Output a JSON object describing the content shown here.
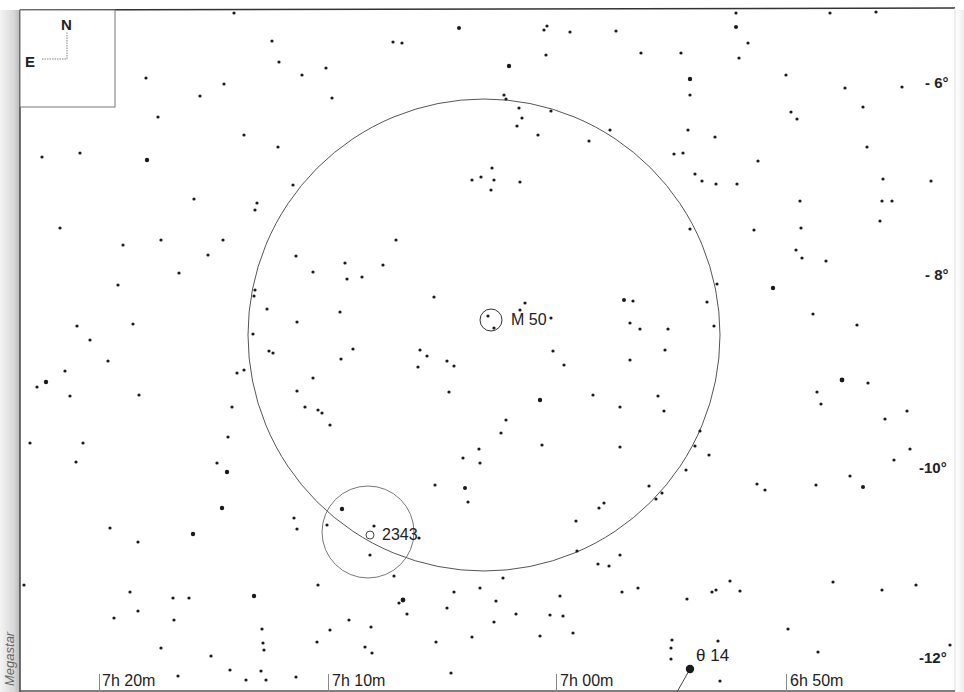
{
  "chart": {
    "title": "",
    "watermark": "Megastar",
    "compass": {
      "north": "N",
      "east": "E"
    },
    "dec_labels": [
      {
        "text": "- 6°",
        "x": 925,
        "y": 74
      },
      {
        "text": "- 8°",
        "x": 925,
        "y": 266
      },
      {
        "text": "-10°",
        "x": 920,
        "y": 460
      },
      {
        "text": "-12°",
        "x": 920,
        "y": 650
      }
    ],
    "ra_labels": [
      {
        "text": "7h 20m",
        "x": 102,
        "tick_x": 99
      },
      {
        "text": "7h 10m",
        "x": 332,
        "tick_x": 328
      },
      {
        "text": "7h 00m",
        "x": 560,
        "tick_x": 556
      },
      {
        "text": "6h 50m",
        "x": 790,
        "tick_x": 786
      }
    ],
    "objects": [
      {
        "name": "M 50",
        "label_x": 511,
        "label_y": 312,
        "marker": {
          "cx": 491,
          "cy": 320,
          "r": 11
        }
      },
      {
        "name": "2343",
        "label_x": 382,
        "label_y": 527,
        "marker": {
          "cx": 370,
          "cy": 535,
          "r": 4
        }
      },
      {
        "name": "θ 14",
        "label_x": 696,
        "label_y": 647
      }
    ],
    "fields_of_view": [
      {
        "name": "large-fov-circle",
        "cx": 484,
        "cy": 335,
        "r": 236
      },
      {
        "name": "small-fov-circle",
        "cx": 368,
        "cy": 532,
        "r": 46
      }
    ],
    "colors": {
      "background": "#ffffff",
      "star": "#1a1a1a",
      "line": "#555555",
      "text": "#222222"
    }
  },
  "chart_data": {
    "type": "scatter",
    "xlabel": "Right Ascension",
    "ylabel": "Declination",
    "x_ticks": [
      "7h 20m",
      "7h 10m",
      "7h 00m",
      "6h 50m"
    ],
    "y_ticks": [
      "-6°",
      "-8°",
      "-10°",
      "-12°"
    ],
    "annotations": [
      "M 50",
      "2343",
      "θ 14",
      "N",
      "E"
    ],
    "grid": false,
    "stars": [
      [
        234,
        13,
        1.6
      ],
      [
        272,
        41,
        1.6
      ],
      [
        279,
        62,
        1.6
      ],
      [
        302,
        75,
        1.6
      ],
      [
        326,
        68,
        1.6
      ],
      [
        332,
        98,
        1.6
      ],
      [
        393,
        42,
        1.6
      ],
      [
        402,
        43,
        1.6
      ],
      [
        459,
        28,
        2
      ],
      [
        146,
        78,
        1.6
      ],
      [
        200,
        96,
        1.6
      ],
      [
        224,
        84,
        1.6
      ],
      [
        158,
        117,
        1.6
      ],
      [
        244,
        135,
        1.6
      ],
      [
        278,
        147,
        1.6
      ],
      [
        42,
        157,
        1.6
      ],
      [
        80,
        153,
        1.6
      ],
      [
        147,
        160,
        2.2
      ],
      [
        194,
        199,
        1.6
      ],
      [
        257,
        203,
        1.6
      ],
      [
        60,
        228,
        1.6
      ],
      [
        123,
        245,
        1.6
      ],
      [
        161,
        240,
        1.6
      ],
      [
        179,
        273,
        1.6
      ],
      [
        223,
        240,
        1.6
      ],
      [
        208,
        255,
        1.6
      ],
      [
        118,
        285,
        1.6
      ],
      [
        133,
        324,
        1.6
      ],
      [
        77,
        326,
        1.6
      ],
      [
        90,
        340,
        1.6
      ],
      [
        108,
        361,
        1.6
      ],
      [
        46,
        382,
        2.2
      ],
      [
        65,
        371,
        1.6
      ],
      [
        37,
        387,
        1.6
      ],
      [
        70,
        396,
        1.6
      ],
      [
        139,
        395,
        1.6
      ],
      [
        83,
        443,
        1.6
      ],
      [
        76,
        462,
        1.6
      ],
      [
        30,
        443,
        1.6
      ],
      [
        237,
        373,
        1.6
      ],
      [
        244,
        370,
        1.6
      ],
      [
        232,
        407,
        1.6
      ],
      [
        228,
        437,
        1.6
      ],
      [
        217,
        463,
        1.6
      ],
      [
        227,
        472,
        2.2
      ],
      [
        222,
        508,
        2.2
      ],
      [
        193,
        534,
        2.2
      ],
      [
        110,
        528,
        1.6
      ],
      [
        138,
        542,
        1.6
      ],
      [
        24,
        585,
        1.6
      ],
      [
        130,
        592,
        1.6
      ],
      [
        138,
        611,
        1.6
      ],
      [
        173,
        598,
        1.6
      ],
      [
        189,
        598,
        1.6
      ],
      [
        254,
        596,
        2.2
      ],
      [
        114,
        618,
        1.6
      ],
      [
        174,
        620,
        1.6
      ],
      [
        211,
        656,
        1.6
      ],
      [
        161,
        648,
        1.6
      ],
      [
        262,
        629,
        1.6
      ],
      [
        263,
        643,
        1.6
      ],
      [
        293,
        185,
        1.6
      ],
      [
        255,
        290,
        1.6
      ],
      [
        255,
        210,
        1.6
      ],
      [
        296,
        256,
        1.6
      ],
      [
        313,
        272,
        1.6
      ],
      [
        345,
        263,
        1.6
      ],
      [
        347,
        279,
        1.6
      ],
      [
        362,
        277,
        1.6
      ],
      [
        383,
        265,
        1.6
      ],
      [
        396,
        240,
        1.6
      ],
      [
        254,
        296,
        1.6
      ],
      [
        267,
        309,
        1.6
      ],
      [
        269,
        351,
        1.6
      ],
      [
        253,
        334,
        1.6
      ],
      [
        273,
        353,
        1.6
      ],
      [
        297,
        322,
        1.6
      ],
      [
        353,
        349,
        1.6
      ],
      [
        340,
        312,
        1.6
      ],
      [
        341,
        359,
        1.6
      ],
      [
        313,
        378,
        1.6
      ],
      [
        305,
        407,
        1.6
      ],
      [
        322,
        413,
        1.6
      ],
      [
        318,
        410,
        1.6
      ],
      [
        297,
        391,
        1.6
      ],
      [
        330,
        425,
        1.6
      ],
      [
        434,
        297,
        1.6
      ],
      [
        420,
        350,
        1.6
      ],
      [
        427,
        356,
        1.6
      ],
      [
        418,
        367,
        1.6
      ],
      [
        447,
        361,
        1.6
      ],
      [
        449,
        392,
        1.6
      ],
      [
        454,
        366,
        1.6
      ],
      [
        488,
        316,
        1.6
      ],
      [
        494,
        328,
        1.6
      ],
      [
        525,
        303,
        1.6
      ],
      [
        520,
        310,
        1.6
      ],
      [
        551,
        318,
        1.6
      ],
      [
        553,
        351,
        1.6
      ],
      [
        564,
        365,
        1.6
      ],
      [
        624,
        300,
        2
      ],
      [
        633,
        301,
        1.6
      ],
      [
        630,
        323,
        1.6
      ],
      [
        630,
        360,
        1.6
      ],
      [
        640,
        329,
        1.6
      ],
      [
        668,
        329,
        1.6
      ],
      [
        665,
        350,
        1.6
      ],
      [
        658,
        396,
        1.6
      ],
      [
        664,
        411,
        1.6
      ],
      [
        540,
        400,
        2.2
      ],
      [
        506,
        420,
        1.6
      ],
      [
        542,
        445,
        1.6
      ],
      [
        501,
        433,
        1.6
      ],
      [
        479,
        449,
        1.6
      ],
      [
        463,
        458,
        1.6
      ],
      [
        480,
        463,
        1.6
      ],
      [
        593,
        395,
        1.6
      ],
      [
        620,
        407,
        1.6
      ],
      [
        620,
        447,
        1.6
      ],
      [
        472,
        180,
        1.6
      ],
      [
        481,
        177,
        1.6
      ],
      [
        492,
        168,
        1.6
      ],
      [
        494,
        180,
        1.6
      ],
      [
        491,
        190,
        1.6
      ],
      [
        520,
        182,
        1.6
      ],
      [
        519,
        108,
        1.6
      ],
      [
        522,
        118,
        1.6
      ],
      [
        517,
        126,
        1.6
      ],
      [
        538,
        135,
        1.6
      ],
      [
        551,
        111,
        1.6
      ],
      [
        589,
        141,
        1.6
      ],
      [
        610,
        130,
        1.6
      ],
      [
        506,
        99,
        1.6
      ],
      [
        504,
        95,
        1.6
      ],
      [
        509,
        66,
        2.2
      ],
      [
        546,
        55,
        1.6
      ],
      [
        547,
        26,
        1.6
      ],
      [
        544,
        30,
        1.6
      ],
      [
        570,
        32,
        1.6
      ],
      [
        616,
        31,
        1.6
      ],
      [
        641,
        53,
        1.6
      ],
      [
        681,
        53,
        1.6
      ],
      [
        690,
        79,
        2.2
      ],
      [
        690,
        95,
        1.6
      ],
      [
        688,
        130,
        1.6
      ],
      [
        674,
        154,
        1.6
      ],
      [
        683,
        153,
        1.6
      ],
      [
        715,
        137,
        1.6
      ],
      [
        695,
        174,
        1.6
      ],
      [
        702,
        181,
        1.6
      ],
      [
        716,
        184,
        1.6
      ],
      [
        736,
        13,
        1.6
      ],
      [
        736,
        27,
        2
      ],
      [
        748,
        43,
        1.6
      ],
      [
        739,
        58,
        1.6
      ],
      [
        786,
        75,
        1.6
      ],
      [
        791,
        112,
        1.6
      ],
      [
        797,
        119,
        1.6
      ],
      [
        830,
        13,
        1.6
      ],
      [
        876,
        12,
        1.6
      ],
      [
        845,
        88,
        1.6
      ],
      [
        902,
        87,
        1.6
      ],
      [
        863,
        107,
        1.6
      ],
      [
        867,
        147,
        1.6
      ],
      [
        883,
        179,
        1.6
      ],
      [
        931,
        181,
        1.6
      ],
      [
        882,
        201,
        1.6
      ],
      [
        892,
        201,
        1.6
      ],
      [
        880,
        221,
        1.6
      ],
      [
        800,
        201,
        1.6
      ],
      [
        801,
        228,
        1.6
      ],
      [
        758,
        161,
        1.6
      ],
      [
        737,
        184,
        1.6
      ],
      [
        754,
        230,
        1.6
      ],
      [
        796,
        250,
        1.6
      ],
      [
        802,
        258,
        1.6
      ],
      [
        826,
        261,
        1.6
      ],
      [
        773,
        288,
        2.2
      ],
      [
        813,
        314,
        1.6
      ],
      [
        857,
        325,
        1.6
      ],
      [
        842,
        380,
        2.4
      ],
      [
        868,
        383,
        1.6
      ],
      [
        817,
        392,
        1.6
      ],
      [
        885,
        419,
        1.6
      ],
      [
        907,
        411,
        1.6
      ],
      [
        910,
        449,
        1.6
      ],
      [
        863,
        487,
        2
      ],
      [
        816,
        485,
        1.6
      ],
      [
        821,
        404,
        1.6
      ],
      [
        850,
        476,
        1.6
      ],
      [
        894,
        460,
        1.6
      ],
      [
        690,
        229,
        1.6
      ],
      [
        717,
        284,
        1.6
      ],
      [
        707,
        302,
        1.6
      ],
      [
        714,
        326,
        1.6
      ],
      [
        695,
        446,
        1.6
      ],
      [
        700,
        431,
        1.6
      ],
      [
        709,
        455,
        1.6
      ],
      [
        686,
        470,
        1.6
      ],
      [
        662,
        493,
        1.6
      ],
      [
        656,
        499,
        1.6
      ],
      [
        649,
        486,
        1.6
      ],
      [
        604,
        503,
        1.6
      ],
      [
        599,
        508,
        1.6
      ],
      [
        576,
        521,
        1.6
      ],
      [
        577,
        551,
        1.6
      ],
      [
        620,
        555,
        1.6
      ],
      [
        598,
        564,
        1.6
      ],
      [
        609,
        566,
        1.6
      ],
      [
        622,
        592,
        1.6
      ],
      [
        638,
        588,
        1.6
      ],
      [
        687,
        599,
        1.6
      ],
      [
        712,
        592,
        1.6
      ],
      [
        730,
        581,
        1.6
      ],
      [
        740,
        591,
        1.6
      ],
      [
        716,
        590,
        1.6
      ],
      [
        757,
        484,
        1.6
      ],
      [
        765,
        490,
        1.6
      ],
      [
        833,
        582,
        1.6
      ],
      [
        882,
        590,
        1.6
      ],
      [
        916,
        585,
        1.6
      ],
      [
        480,
        588,
        1.6
      ],
      [
        496,
        601,
        1.6
      ],
      [
        550,
        615,
        1.6
      ],
      [
        540,
        636,
        1.6
      ],
      [
        516,
        614,
        1.6
      ],
      [
        560,
        596,
        1.6
      ],
      [
        454,
        592,
        1.6
      ],
      [
        447,
        608,
        1.6
      ],
      [
        472,
        637,
        1.6
      ],
      [
        494,
        622,
        1.6
      ],
      [
        503,
        578,
        1.6
      ],
      [
        563,
        616,
        1.6
      ],
      [
        573,
        633,
        1.6
      ],
      [
        672,
        640,
        1.6
      ],
      [
        671,
        648,
        1.6
      ],
      [
        671,
        659,
        1.6
      ],
      [
        718,
        641,
        1.6
      ],
      [
        720,
        681,
        1.6
      ],
      [
        818,
        652,
        1.6
      ],
      [
        788,
        629,
        1.6
      ],
      [
        950,
        645,
        1.6
      ],
      [
        342,
        509,
        2.2
      ],
      [
        374,
        526,
        1.6
      ],
      [
        419,
        538,
        1.6
      ],
      [
        465,
        488,
        2
      ],
      [
        468,
        502,
        1.6
      ],
      [
        435,
        485,
        1.6
      ],
      [
        394,
        576,
        1.6
      ],
      [
        403,
        600,
        2.4
      ],
      [
        399,
        603,
        1.6
      ],
      [
        407,
        614,
        1.6
      ],
      [
        327,
        525,
        1.6
      ],
      [
        294,
        518,
        1.6
      ],
      [
        297,
        529,
        1.6
      ],
      [
        370,
        555,
        1.6
      ],
      [
        318,
        585,
        1.6
      ],
      [
        330,
        630,
        1.6
      ],
      [
        349,
        620,
        1.6
      ],
      [
        371,
        627,
        1.6
      ],
      [
        372,
        653,
        1.6
      ],
      [
        365,
        647,
        1.6
      ],
      [
        436,
        642,
        1.6
      ],
      [
        451,
        673,
        1.6
      ],
      [
        261,
        671,
        1.6
      ],
      [
        230,
        670,
        1.6
      ],
      [
        178,
        676,
        1.6
      ],
      [
        246,
        680,
        1.6
      ],
      [
        266,
        680,
        1.6
      ],
      [
        264,
        650,
        1.6
      ],
      [
        296,
        677,
        1.6
      ],
      [
        317,
        642,
        1.6
      ]
    ]
  }
}
